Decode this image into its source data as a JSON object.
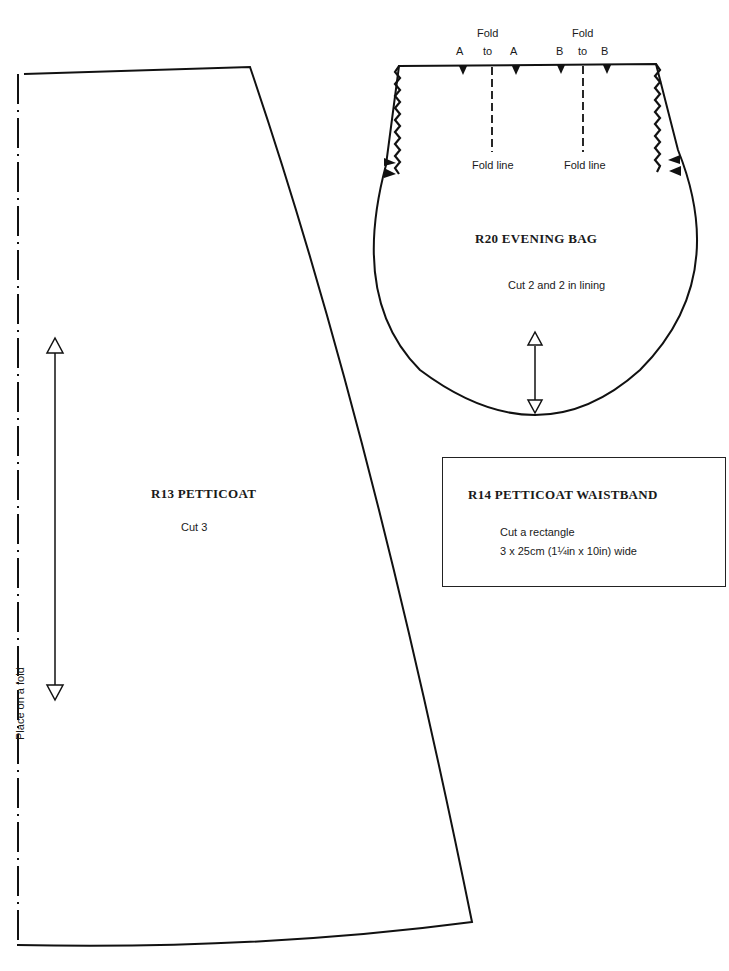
{
  "petticoat": {
    "title": "R13  PETTICOAT",
    "cut": "Cut 3",
    "fold_label": "Place on a fold"
  },
  "evening_bag": {
    "title": "R20  EVENING BAG",
    "cut": "Cut 2 and 2 in lining",
    "fold_a": {
      "top": "Fold",
      "left": "A",
      "mid": "to",
      "right": "A",
      "line_label": "Fold line"
    },
    "fold_b": {
      "top": "Fold",
      "left": "B",
      "mid": "to",
      "right": "B",
      "line_label": "Fold line"
    }
  },
  "waistband": {
    "title": "R14  PETTICOAT WAISTBAND",
    "line1": "Cut a rectangle",
    "line2": "3 x 25cm (1¼in x 10in) wide"
  },
  "colors": {
    "line": "#111111",
    "background": "#ffffff"
  }
}
